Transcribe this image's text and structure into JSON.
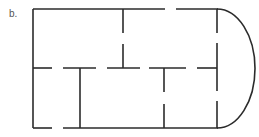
{
  "figure": {
    "label": "b.",
    "stroke_color": "#2b2b2b",
    "background": "#ffffff"
  }
}
